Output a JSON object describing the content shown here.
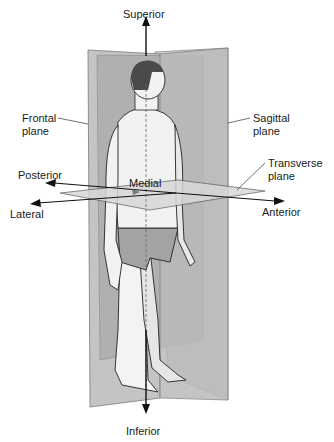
{
  "diagram": {
    "labels": {
      "superior": "Superior",
      "inferior": "Inferior",
      "frontal_plane_line1": "Frontal",
      "frontal_plane_line2": "plane",
      "sagittal_plane_line1": "Sagittal",
      "sagittal_plane_line2": "plane",
      "transverse_plane_line1": "Transverse",
      "transverse_plane_line2": "plane",
      "posterior": "Posterior",
      "lateral": "Lateral",
      "medial": "Medial",
      "anterior": "Anterior"
    },
    "colors": {
      "frontal_plane": "#bdbdbd",
      "frontal_plane_inner": "#a9a9a9",
      "sagittal_plane": "#c9c9c9",
      "transverse_plane": "#d4d4d4",
      "skin": "#f2f2f2",
      "hair": "#4a4a4a",
      "briefs": "#9a9a9a",
      "arrow": "#111111"
    }
  }
}
